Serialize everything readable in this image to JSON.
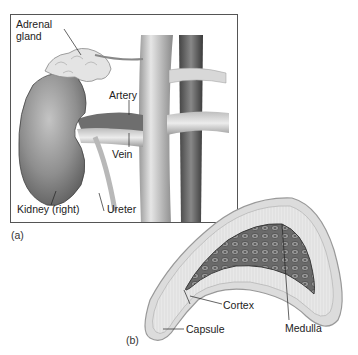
{
  "figure": {
    "panel_a": {
      "id_label": "(a)",
      "labels": {
        "adrenal_gland_line1": "Adrenal",
        "adrenal_gland_line2": "gland",
        "artery": "Artery",
        "vein": "Vein",
        "kidney": "Kidney (right)",
        "ureter": "Ureter"
      }
    },
    "panel_b": {
      "id_label": "(b)",
      "labels": {
        "cortex": "Cortex",
        "medulla": "Medulla",
        "capsule": "Capsule"
      }
    },
    "colors": {
      "border": "#555555",
      "tissue_light": "#e4e4e4",
      "tissue_mid": "#a8a8a8",
      "tissue_dark": "#5a5a5a",
      "text": "#222222"
    }
  }
}
